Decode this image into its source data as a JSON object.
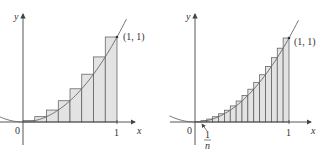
{
  "figure": {
    "panels": [
      {
        "id": "left",
        "n": 8,
        "axis_labels": {
          "x": "x",
          "y": "y"
        },
        "tick_labels": {
          "origin": "0",
          "x_one": "1"
        },
        "point_label": "(1, 1)"
      },
      {
        "id": "right",
        "n": 16,
        "axis_labels": {
          "x": "x",
          "y": "y"
        },
        "tick_labels": {
          "origin": "0",
          "x_one": "1"
        },
        "point_label": "(1, 1)",
        "width_label": {
          "numerator": "1",
          "denominator": "n"
        }
      }
    ],
    "colors": {
      "rect_fill": "#e3e3e3",
      "rect_stroke": "#555555",
      "curve": "#666666",
      "axis": "#444444",
      "text": "#333333"
    }
  },
  "chart_data": [
    {
      "type": "area",
      "title": "",
      "function": "y = x^2",
      "method": "right-endpoint rectangles",
      "n": 8,
      "x": [
        0.125,
        0.25,
        0.375,
        0.5,
        0.625,
        0.75,
        0.875,
        1.0
      ],
      "values": [
        0.015625,
        0.0625,
        0.140625,
        0.25,
        0.390625,
        0.5625,
        0.765625,
        1.0
      ],
      "xlabel": "x",
      "ylabel": "y",
      "annotations": [
        "(1, 1)",
        "0",
        "1"
      ],
      "xlim": [
        0,
        1
      ],
      "ylim": [
        0,
        1
      ],
      "grid": false
    },
    {
      "type": "area",
      "title": "",
      "function": "y = x^2",
      "method": "right-endpoint rectangles",
      "n": 16,
      "x": [
        0.0625,
        0.125,
        0.1875,
        0.25,
        0.3125,
        0.375,
        0.4375,
        0.5,
        0.5625,
        0.625,
        0.6875,
        0.75,
        0.8125,
        0.875,
        0.9375,
        1.0
      ],
      "values": [
        0.0039,
        0.0156,
        0.0352,
        0.0625,
        0.0977,
        0.1406,
        0.1914,
        0.25,
        0.3164,
        0.3906,
        0.4727,
        0.5625,
        0.6602,
        0.7656,
        0.8789,
        1.0
      ],
      "xlabel": "x",
      "ylabel": "y",
      "annotations": [
        "(1, 1)",
        "0",
        "1",
        "1/n"
      ],
      "xlim": [
        0,
        1
      ],
      "ylim": [
        0,
        1
      ],
      "grid": false
    }
  ]
}
